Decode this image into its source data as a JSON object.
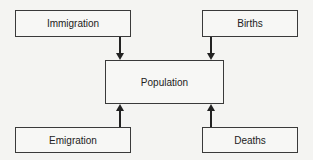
{
  "diagram": {
    "nodes": {
      "immigration": "Immigration",
      "births": "Births",
      "population": "Population",
      "emigration": "Emigration",
      "deaths": "Deaths"
    },
    "edges": [
      {
        "from": "Immigration",
        "to": "Population"
      },
      {
        "from": "Births",
        "to": "Population"
      },
      {
        "from": "Emigration",
        "to": "Population"
      },
      {
        "from": "Deaths",
        "to": "Population"
      }
    ]
  }
}
